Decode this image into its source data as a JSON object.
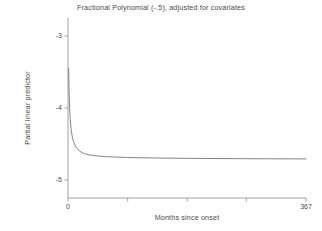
{
  "chart_data": {
    "type": "line",
    "title": "Fractional Polynomial (-.5), adjusted for covariates",
    "xlabel": "Months since onset",
    "ylabel": "Partial linear predictor",
    "xlim": [
      0,
      367
    ],
    "ylim": [
      -5.25,
      -2.75
    ],
    "grid": false,
    "legend": null,
    "y_ticks": [
      {
        "value": -3,
        "label": "-3"
      },
      {
        "value": -4,
        "label": "-4"
      },
      {
        "value": -5,
        "label": "-5"
      }
    ],
    "x_ticks": [
      {
        "value": 0,
        "label": "0"
      },
      {
        "value": 92,
        "label": ""
      },
      {
        "value": 184,
        "label": ""
      },
      {
        "value": 275,
        "label": ""
      },
      {
        "value": 367,
        "label": "367"
      }
    ],
    "series": [
      {
        "name": "Fractional polynomial (-.5) fit",
        "color": "#6e6e6e",
        "x": [
          1,
          1.5,
          2,
          2.5,
          3,
          3.5,
          4,
          5,
          6,
          7,
          8,
          9,
          10,
          12,
          14,
          16,
          18,
          20,
          24,
          28,
          32,
          36,
          42,
          48,
          56,
          64,
          72,
          84,
          96,
          110,
          125,
          140,
          160,
          180,
          200,
          225,
          250,
          275,
          300,
          330,
          367
        ],
        "y": [
          -3.45,
          -3.71,
          -3.88,
          -4.0,
          -4.09,
          -4.16,
          -4.22,
          -4.31,
          -4.37,
          -4.42,
          -4.45,
          -4.48,
          -4.5,
          -4.54,
          -4.56,
          -4.58,
          -4.6,
          -4.61,
          -4.63,
          -4.64,
          -4.65,
          -4.655,
          -4.662,
          -4.668,
          -4.674,
          -4.678,
          -4.681,
          -4.685,
          -4.688,
          -4.691,
          -4.693,
          -4.695,
          -4.697,
          -4.699,
          -4.7,
          -4.702,
          -4.703,
          -4.704,
          -4.705,
          -4.706,
          -4.707
        ]
      }
    ]
  },
  "axes_geometry": {
    "plot_left_px": 68,
    "plot_right_px": 306,
    "plot_top_px": 18,
    "plot_bottom_px": 198
  }
}
